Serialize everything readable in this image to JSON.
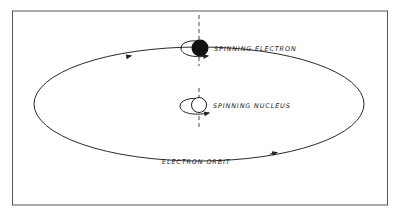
{
  "figure": {
    "labels": {
      "electron": "SPINNING ELECTRON",
      "nucleus": "SPINNING NUCLEUS",
      "orbit": "ELECTRON ORBIT"
    },
    "colors": {
      "line": "#2a2a2a",
      "frame": "#555555",
      "background": "#ffffff"
    }
  }
}
